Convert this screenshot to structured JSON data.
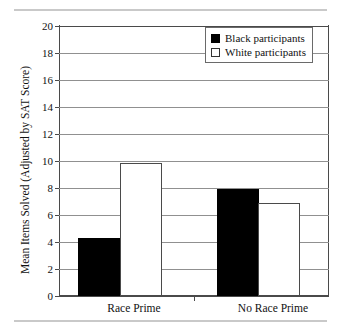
{
  "chart_data": {
    "type": "bar",
    "title": "",
    "subtitle": "",
    "xlabel": "",
    "ylabel": "Mean Items Solved (Adjusted by SAT Score)",
    "categories": [
      "Race Prime",
      "No Race Prime"
    ],
    "series": [
      {
        "name": "Black participants",
        "color": "#000000",
        "values": [
          4.3,
          7.9
        ]
      },
      {
        "name": "White participants",
        "color": "#ffffff",
        "values": [
          9.85,
          6.9
        ]
      }
    ],
    "ylim": [
      0,
      20
    ],
    "yticks": [
      0,
      2,
      4,
      6,
      8,
      10,
      12,
      14,
      16,
      18,
      20
    ],
    "ytick_labels": [
      "0",
      "2",
      "4",
      "6",
      "8",
      "10",
      "12",
      "14",
      "16",
      "18",
      "20"
    ],
    "grid": true,
    "grid_axis": "y",
    "legend_position": "top-right",
    "legend": [
      {
        "label": "Black participants",
        "swatch": "black"
      },
      {
        "label": "White participants",
        "swatch": "white"
      }
    ]
  },
  "figure": {
    "top_rule_color": "#c9c9c9",
    "bottom_rule_color": "#c9c9c9",
    "background": "#ffffff"
  }
}
